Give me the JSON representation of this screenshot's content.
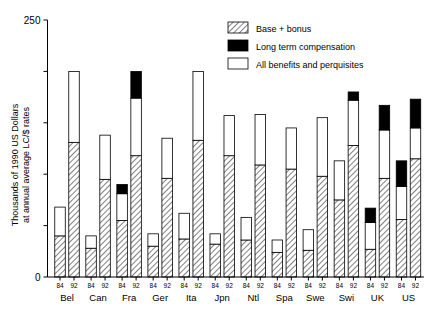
{
  "chart_data": {
    "type": "bar",
    "title": "",
    "xlabel": "",
    "ylabel": "Thousands of 1990 US Dollars at annual average LC/$ rates",
    "ylim": [
      0,
      250
    ],
    "yticks": [
      0,
      50,
      100,
      150,
      200,
      250
    ],
    "ytick_labels": [
      "0",
      "",
      "",
      "",
      "",
      "250"
    ],
    "grid": false,
    "stacked": true,
    "legend_position": "top-right",
    "legend": [
      {
        "label": "Base + bonus",
        "pattern": "hatched"
      },
      {
        "label": "Long term compensation",
        "pattern": "solid-black"
      },
      {
        "label": "All benefits and perquisites",
        "pattern": "white-outline"
      }
    ],
    "series": [
      {
        "name": "Base + bonus",
        "key": "base"
      },
      {
        "name": "Long term compensation",
        "key": "ltc"
      },
      {
        "name": "All benefits and perquisites",
        "key": "benefits"
      }
    ],
    "groups": [
      {
        "country": "Bel",
        "bars": [
          {
            "year": "84",
            "base": 40,
            "ltc": 0,
            "benefits": 28,
            "total": 68
          },
          {
            "year": "92",
            "base": 131,
            "ltc": 0,
            "benefits": 69,
            "total": 200
          }
        ]
      },
      {
        "country": "Can",
        "bars": [
          {
            "year": "84",
            "base": 28,
            "ltc": 0,
            "benefits": 12,
            "total": 40
          },
          {
            "year": "92",
            "base": 95,
            "ltc": 0,
            "benefits": 43,
            "total": 138
          }
        ]
      },
      {
        "country": "Fra",
        "bars": [
          {
            "year": "84",
            "base": 55,
            "ltc": 9,
            "benefits": 26,
            "total": 90
          },
          {
            "year": "92",
            "base": 118,
            "ltc": 26,
            "benefits": 56,
            "total": 200
          }
        ]
      },
      {
        "country": "Ger",
        "bars": [
          {
            "year": "84",
            "base": 30,
            "ltc": 0,
            "benefits": 12,
            "total": 42
          },
          {
            "year": "92",
            "base": 96,
            "ltc": 0,
            "benefits": 39,
            "total": 135
          }
        ]
      },
      {
        "country": "Ita",
        "bars": [
          {
            "year": "84",
            "base": 37,
            "ltc": 0,
            "benefits": 25,
            "total": 62
          },
          {
            "year": "92",
            "base": 133,
            "ltc": 0,
            "benefits": 67,
            "total": 200
          }
        ]
      },
      {
        "country": "Jpn",
        "bars": [
          {
            "year": "84",
            "base": 32,
            "ltc": 0,
            "benefits": 10,
            "total": 42
          },
          {
            "year": "92",
            "base": 118,
            "ltc": 0,
            "benefits": 39,
            "total": 157
          }
        ]
      },
      {
        "country": "Ntl",
        "bars": [
          {
            "year": "84",
            "base": 36,
            "ltc": 0,
            "benefits": 22,
            "total": 58
          },
          {
            "year": "92",
            "base": 109,
            "ltc": 0,
            "benefits": 49,
            "total": 158
          }
        ]
      },
      {
        "country": "Spa",
        "bars": [
          {
            "year": "84",
            "base": 24,
            "ltc": 0,
            "benefits": 12,
            "total": 36
          },
          {
            "year": "92",
            "base": 105,
            "ltc": 0,
            "benefits": 40,
            "total": 145
          }
        ]
      },
      {
        "country": "Swe",
        "bars": [
          {
            "year": "84",
            "base": 26,
            "ltc": 0,
            "benefits": 20,
            "total": 46
          },
          {
            "year": "92",
            "base": 98,
            "ltc": 0,
            "benefits": 57,
            "total": 155
          }
        ]
      },
      {
        "country": "Swi",
        "bars": [
          {
            "year": "84",
            "base": 75,
            "ltc": 0,
            "benefits": 38,
            "total": 113
          },
          {
            "year": "92",
            "base": 128,
            "ltc": 8,
            "benefits": 44,
            "total": 180
          }
        ]
      },
      {
        "country": "UK",
        "bars": [
          {
            "year": "84",
            "base": 27,
            "ltc": 14,
            "benefits": 26,
            "total": 67
          },
          {
            "year": "92",
            "base": 96,
            "ltc": 24,
            "benefits": 47,
            "total": 167
          }
        ]
      },
      {
        "country": "US",
        "bars": [
          {
            "year": "84",
            "base": 56,
            "ltc": 25,
            "benefits": 32,
            "total": 113
          },
          {
            "year": "92",
            "base": 115,
            "ltc": 28,
            "benefits": 30,
            "total": 173
          }
        ]
      }
    ]
  },
  "colors": {
    "axis": "#000000",
    "black_segment": "#000000",
    "white_segment": "#ffffff",
    "hatch_stroke": "#555555",
    "background": "#ffffff"
  }
}
